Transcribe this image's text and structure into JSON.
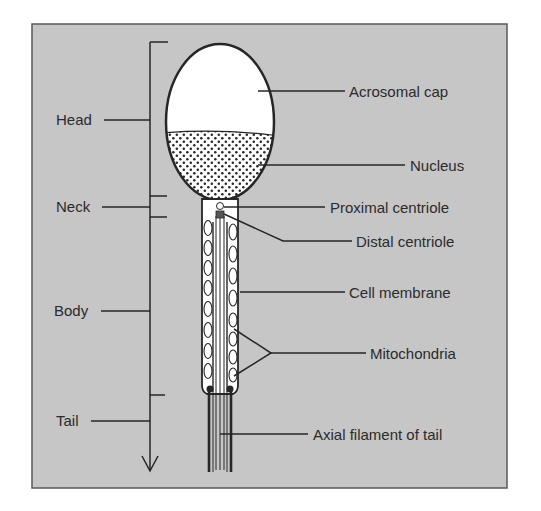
{
  "diagram": {
    "colors": {
      "panel_fill": "#c6c6c6",
      "panel_border": "#5a5a5a",
      "ink": "#262626",
      "head_fill": "#ffffff"
    },
    "region_labels": [
      {
        "id": "head",
        "text": "Head"
      },
      {
        "id": "neck",
        "text": "Neck"
      },
      {
        "id": "body",
        "text": "Body"
      },
      {
        "id": "tail",
        "text": "Tail"
      }
    ],
    "part_labels": [
      {
        "id": "acrosomal-cap",
        "text": "Acrosomal cap"
      },
      {
        "id": "nucleus",
        "text": "Nucleus"
      },
      {
        "id": "proximal-centriole",
        "text": "Proximal centriole"
      },
      {
        "id": "distal-centriole",
        "text": "Distal centriole"
      },
      {
        "id": "cell-membrane",
        "text": "Cell membrane"
      },
      {
        "id": "mitochondria",
        "text": "Mitochondria"
      },
      {
        "id": "axial-filament",
        "text": "Axial filament of tail"
      }
    ]
  }
}
